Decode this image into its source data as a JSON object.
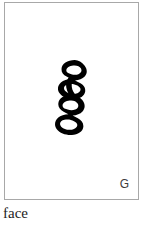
{
  "page": {
    "background_color": "#ffffff",
    "width": 151,
    "height": 225
  },
  "card": {
    "border_color": "#a8a8a8",
    "background_color": "#ffffff",
    "glyph": {
      "icon_name": "section-sign-glyph",
      "character": "§",
      "description": "bold section sign",
      "ink_color": "#000000"
    },
    "corner_label": "G",
    "corner_label_color": "#3c3c3c"
  },
  "caption": {
    "text": "face",
    "color": "#1d1d1d"
  }
}
